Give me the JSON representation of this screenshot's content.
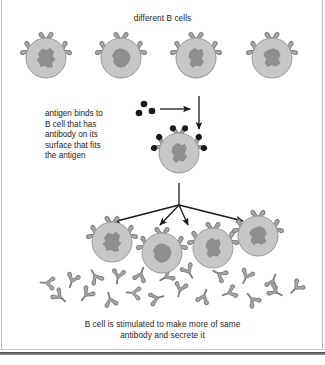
{
  "figure": {
    "title_top": "different B cells",
    "label_antigen": "antigen binds to\nB cell that has\nantibody on its\nsurface that fits\nthe antigen",
    "caption_bottom": "B cell is stimulated to make more of same\nantibody and secrete it"
  },
  "colors": {
    "cell_fill": "#c6c6c6",
    "cell_stroke": "#9a9a9a",
    "nucleus_fill": "#8f8f8f",
    "nucleus_stroke": "#7a7a7a",
    "antibody_fill": "#a8a8a8",
    "antibody_stroke": "#7d7d7d",
    "antigen_fill": "#1a1a1a",
    "arrow": "#1a1a1a",
    "text": "#1d1d1d",
    "border": "#b9b9b9"
  },
  "naive_cells": [
    {
      "name": "b-cell-1",
      "cx": 46,
      "cy": 58,
      "r": 20,
      "nucleus": 1
    },
    {
      "name": "b-cell-2",
      "cx": 121,
      "cy": 58,
      "r": 20,
      "nucleus": 2
    },
    {
      "name": "b-cell-3",
      "cx": 196,
      "cy": 58,
      "r": 20,
      "nucleus": 3
    },
    {
      "name": "b-cell-4",
      "cx": 272,
      "cy": 58,
      "r": 20,
      "nucleus": 4
    }
  ],
  "activated_cell": {
    "name": "activated-b-cell",
    "cx": 179,
    "cy": 153,
    "r": 20,
    "nucleus": 3
  },
  "daughter_cells": [
    {
      "name": "daughter-cell-1",
      "cx": 112,
      "cy": 242,
      "r": 20,
      "nucleus": 1
    },
    {
      "name": "daughter-cell-2",
      "cx": 162,
      "cy": 253,
      "r": 20,
      "nucleus": 2
    },
    {
      "name": "daughter-cell-3",
      "cx": 213,
      "cy": 248,
      "r": 20,
      "nucleus": 3
    },
    {
      "name": "daughter-cell-4",
      "cx": 258,
      "cy": 236,
      "r": 20,
      "nucleus": 4
    }
  ],
  "antigen_dots_free": [
    {
      "cx": 144,
      "cy": 104,
      "r": 3.3
    },
    {
      "cx": 152,
      "cy": 111,
      "r": 3.3
    },
    {
      "cx": 139,
      "cy": 113,
      "r": 3.3
    }
  ],
  "secreted_antibodies": [
    {
      "x": 72,
      "y": 281,
      "rot": 20
    },
    {
      "x": 95,
      "y": 276,
      "rot": 150
    },
    {
      "x": 118,
      "y": 277,
      "rot": 10
    },
    {
      "x": 141,
      "y": 274,
      "rot": 200
    },
    {
      "x": 166,
      "y": 277,
      "rot": 60
    },
    {
      "x": 189,
      "y": 272,
      "rot": 330
    },
    {
      "x": 219,
      "y": 274,
      "rot": 120
    },
    {
      "x": 246,
      "y": 277,
      "rot": 25
    },
    {
      "x": 273,
      "y": 281,
      "rot": 200
    },
    {
      "x": 60,
      "y": 297,
      "rot": 310
    },
    {
      "x": 86,
      "y": 295,
      "rot": 40
    },
    {
      "x": 110,
      "y": 299,
      "rot": 165
    },
    {
      "x": 133,
      "y": 293,
      "rot": 95
    },
    {
      "x": 157,
      "y": 298,
      "rot": 255
    },
    {
      "x": 180,
      "y": 290,
      "rot": 15
    },
    {
      "x": 204,
      "y": 296,
      "rot": 200
    },
    {
      "x": 229,
      "y": 293,
      "rot": 70
    },
    {
      "x": 252,
      "y": 299,
      "rot": 140
    },
    {
      "x": 276,
      "y": 292,
      "rot": 300
    },
    {
      "x": 47,
      "y": 283,
      "rot": 95
    },
    {
      "x": 296,
      "y": 288,
      "rot": 45
    }
  ],
  "arrows": {
    "antigen_horizontal": {
      "x1": 160,
      "y1": 109,
      "x2": 190,
      "y2": 109
    },
    "activation_vertical": {
      "x1": 199,
      "y1": 96,
      "x2": 199,
      "y2": 129
    },
    "proliferation_stem": {
      "x1": 179,
      "y1": 183,
      "x2": 179,
      "y2": 205
    },
    "branches": [
      {
        "x2": 113,
        "y2": 222
      },
      {
        "x2": 160,
        "y2": 225
      },
      {
        "x2": 188,
        "y2": 225
      },
      {
        "x2": 243,
        "y2": 221
      }
    ]
  }
}
